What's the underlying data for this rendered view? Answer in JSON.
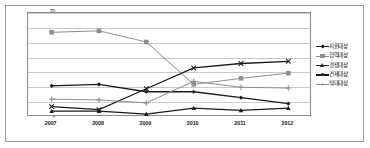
{
  "chart_data": {
    "type": "line",
    "title": "",
    "xlabel": "",
    "ylabel": "",
    "categories": [
      "2007",
      "2008",
      "2009",
      "2010",
      "2011",
      "2012"
    ],
    "ylim": [
      0,
      70
    ],
    "yticks": [
      0,
      10,
      20,
      30,
      40,
      50,
      60,
      70
    ],
    "grid": true,
    "legend_position": "right",
    "series": [
      {
        "name": "지원대상",
        "marker": "diamond",
        "color": "#1a1a1a",
        "values": [
          21,
          22,
          17,
          17,
          13,
          9
        ]
      },
      {
        "name": "협력대상",
        "marker": "square",
        "color": "#8e8e8e",
        "values": [
          57,
          58,
          50.5,
          22,
          26,
          29.5
        ]
      },
      {
        "name": "경쟁대상",
        "marker": "triangle",
        "color": "#1a1a1a",
        "values": [
          4,
          4,
          2,
          6,
          4.5,
          6
        ]
      },
      {
        "name": "견제대상",
        "marker": "cross",
        "color": "#1a1a1a",
        "values": [
          7,
          5,
          19,
          33,
          36,
          37.5
        ]
      },
      {
        "name": "적대대상",
        "marker": "plus",
        "color": "#8e8e8e",
        "values": [
          12,
          11.5,
          9.5,
          24,
          20,
          19.5
        ]
      }
    ]
  },
  "legend": {
    "items": [
      {
        "label": "지원대상"
      },
      {
        "label": "협력대상"
      },
      {
        "label": "경쟁대상"
      },
      {
        "label": "견제대상"
      },
      {
        "label": "적대대상"
      }
    ]
  },
  "axes": {
    "y_tick_labels": [
      "70",
      "60",
      "50",
      "40",
      "30",
      "20",
      "10",
      "0"
    ],
    "x_tick_labels": [
      "2007",
      "2008",
      "2009",
      "2010",
      "2011",
      "2012"
    ]
  }
}
